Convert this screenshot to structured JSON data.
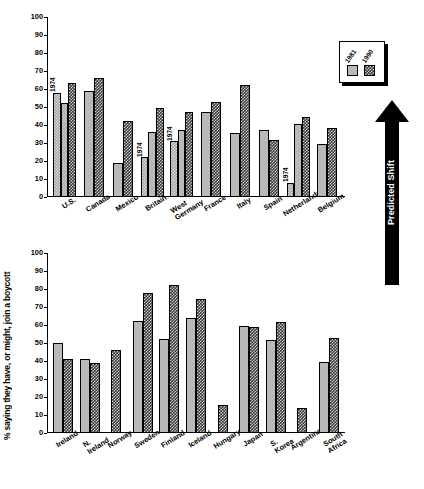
{
  "figure": {
    "ylabel": "% saying they have, or might, join a boycott",
    "annotation_arrow": "Predicted Shift",
    "bar_note": "1974"
  },
  "legend": {
    "items": [
      {
        "label": "1981",
        "pattern": "solid-gray"
      },
      {
        "label": "1990",
        "pattern": "dark-checker"
      }
    ]
  },
  "chart_data": [
    {
      "type": "bar",
      "title": "",
      "xlabel": "",
      "ylabel": "% saying they have, or might, join a boycott",
      "ylim": [
        0,
        100
      ],
      "yticks": [
        0,
        10,
        20,
        30,
        40,
        50,
        60,
        70,
        80,
        90,
        100
      ],
      "grid": false,
      "legend_position": "top-right",
      "categories": [
        "U.S.",
        "Canada",
        "Mexico",
        "Britain",
        "West\nGermany",
        "France",
        "Italy",
        "Spain",
        "Netherlands",
        "Belgium"
      ],
      "series": [
        {
          "name": "1974",
          "values": [
            58,
            null,
            null,
            22,
            31,
            null,
            null,
            null,
            8,
            null
          ]
        },
        {
          "name": "1981",
          "values": [
            52,
            59,
            19,
            36,
            37,
            47.5,
            35.5,
            37,
            40.5,
            29.5
          ]
        },
        {
          "name": "1990",
          "values": [
            63.5,
            66,
            42,
            49.5,
            47.5,
            53,
            62,
            31.5,
            44.5,
            38.5
          ]
        }
      ]
    },
    {
      "type": "bar",
      "title": "",
      "xlabel": "",
      "ylabel": "% saying they have, or might, join a boycott",
      "ylim": [
        0,
        100
      ],
      "yticks": [
        0,
        10,
        20,
        30,
        40,
        50,
        60,
        70,
        80,
        90,
        100
      ],
      "grid": false,
      "categories": [
        "Ireland",
        "N. Ireland",
        "Norway",
        "Sweden",
        "Finland",
        "Iceland",
        "Hungary",
        "Japan",
        "S. Korea",
        "Argentina",
        "South Africa"
      ],
      "series": [
        {
          "name": "1981",
          "values": [
            50,
            41,
            null,
            62,
            52.5,
            64,
            null,
            59.5,
            51.5,
            null,
            39.5
          ]
        },
        {
          "name": "1990",
          "values": [
            41,
            39,
            46,
            78,
            82.5,
            74.5,
            15.5,
            59,
            61.5,
            14,
            53
          ]
        }
      ]
    }
  ]
}
